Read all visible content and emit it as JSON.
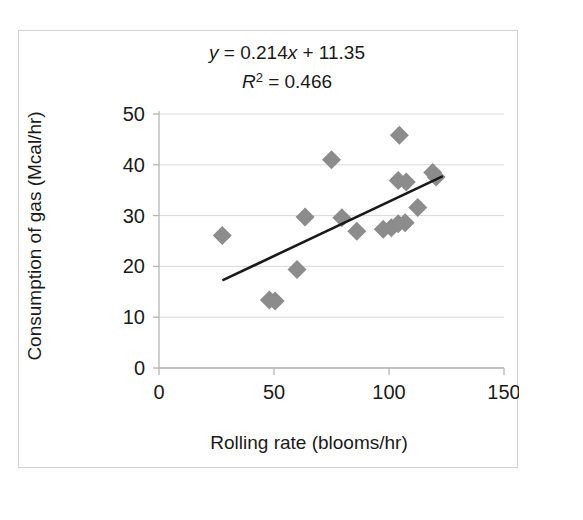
{
  "chart_data": {
    "type": "scatter",
    "title": "",
    "xlabel": "Rolling rate (blooms/hr)",
    "ylabel": "Consumption of gas (Mcal/hr)",
    "xlim": [
      0,
      150
    ],
    "ylim": [
      0,
      50
    ],
    "xticks": [
      0,
      50,
      100,
      150
    ],
    "yticks": [
      0,
      10,
      20,
      30,
      40,
      50
    ],
    "grid": "horizontal",
    "legend": "none",
    "marker_shape": "diamond",
    "marker_color": "#8c8c8c",
    "points": [
      {
        "x": 27.5,
        "y": 26.1
      },
      {
        "x": 48.0,
        "y": 13.4
      },
      {
        "x": 50.5,
        "y": 13.2
      },
      {
        "x": 60.0,
        "y": 19.4
      },
      {
        "x": 63.5,
        "y": 29.7
      },
      {
        "x": 75.0,
        "y": 41.0
      },
      {
        "x": 79.5,
        "y": 29.6
      },
      {
        "x": 86.0,
        "y": 26.9
      },
      {
        "x": 97.5,
        "y": 27.3
      },
      {
        "x": 101.0,
        "y": 27.6
      },
      {
        "x": 104.0,
        "y": 28.4
      },
      {
        "x": 107.0,
        "y": 28.6
      },
      {
        "x": 104.5,
        "y": 45.8
      },
      {
        "x": 104.0,
        "y": 36.9
      },
      {
        "x": 107.5,
        "y": 36.6
      },
      {
        "x": 112.5,
        "y": 31.6
      },
      {
        "x": 119.0,
        "y": 38.5
      },
      {
        "x": 120.5,
        "y": 37.6
      }
    ],
    "trendline": {
      "equation": "y = 0.214x + 11.35",
      "equation_y": "y",
      "equation_rest": " = 0.214",
      "equation_x": "x",
      "equation_tail": " + 11.35",
      "r_squared_symbol": "R",
      "r_squared_exp": "2",
      "r_squared_value": " = 0.466",
      "r_squared": "R² = 0.466",
      "slope": 0.214,
      "intercept": 11.35,
      "x_start": 28,
      "x_end": 123,
      "color": "#1a1a1a"
    }
  },
  "annotations": {
    "equation_line": "y = 0.214x + 11.35",
    "r2_line": "R² = 0.466"
  }
}
